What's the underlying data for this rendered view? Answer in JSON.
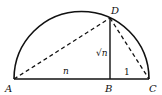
{
  "diagram": {
    "points": {
      "A": {
        "label": "A",
        "x": 14,
        "y": 79
      },
      "B": {
        "label": "B",
        "x": 110,
        "y": 79
      },
      "C": {
        "label": "C",
        "x": 149,
        "y": 79
      },
      "D": {
        "label": "D",
        "x": 110,
        "y": 18
      }
    },
    "segment_labels": {
      "AB": "n",
      "BD": "√n",
      "BC": "1"
    },
    "colors": {
      "stroke": "#111111",
      "background": "#ffffff"
    }
  }
}
